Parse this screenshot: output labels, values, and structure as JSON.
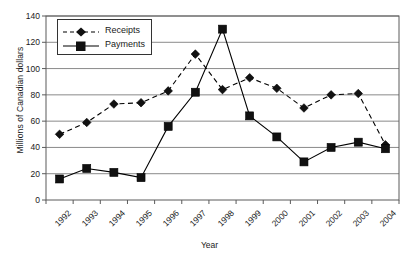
{
  "chart_data": {
    "type": "line",
    "title": "",
    "xlabel": "Year",
    "ylabel": "Millions of Canadian dollars",
    "categories": [
      "1992",
      "1993",
      "1994",
      "1995",
      "1996",
      "1997",
      "1998",
      "1999",
      "2000",
      "2001",
      "2002",
      "2003",
      "2004"
    ],
    "series": [
      {
        "name": "Receipts",
        "marker": "diamond",
        "linestyle": "dashed",
        "color": "#000000",
        "values": [
          50,
          59,
          73,
          74,
          83,
          111,
          84,
          93,
          85,
          70,
          80,
          81,
          42
        ]
      },
      {
        "name": "Payments",
        "marker": "square",
        "linestyle": "solid",
        "color": "#000000",
        "values": [
          16,
          24,
          21,
          17,
          56,
          82,
          130,
          64,
          48,
          29,
          40,
          44,
          39
        ]
      }
    ],
    "ylim": [
      0,
      140
    ],
    "yticks": [
      0,
      20,
      40,
      60,
      80,
      100,
      120,
      140
    ],
    "ytick_labels": [
      "0",
      "20",
      "40",
      "60",
      "80",
      "100",
      "120",
      "140"
    ],
    "grid": true,
    "grid_axis": "y",
    "legend_position": "top-left"
  },
  "axis": {
    "frame_color": "#5a5a5a",
    "grid_color": "#8a8a8a"
  },
  "legend": {
    "entries": [
      {
        "label": "Receipts"
      },
      {
        "label": "Payments"
      }
    ]
  }
}
